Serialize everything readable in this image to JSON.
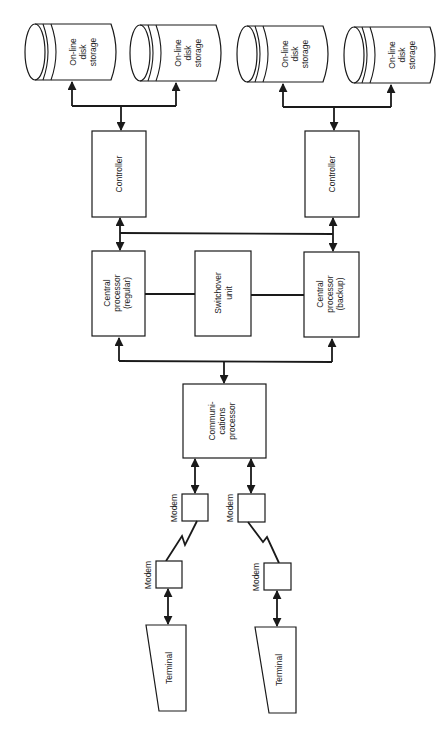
{
  "diagram": {
    "type": "block-diagram",
    "orientation": "rotated-90",
    "colors": {
      "line": "#1a1a1a",
      "background": "#ffffff"
    },
    "disks": [
      {
        "id": "disk-1",
        "lines": [
          "On-line",
          "disk",
          "storage"
        ]
      },
      {
        "id": "disk-2",
        "lines": [
          "On-line",
          "disk",
          "storage"
        ]
      },
      {
        "id": "disk-3",
        "lines": [
          "On-line",
          "disk",
          "storage"
        ]
      },
      {
        "id": "disk-4",
        "lines": [
          "On-line",
          "disk",
          "storage"
        ]
      }
    ],
    "controllers": [
      {
        "id": "controller-left",
        "label": "Controller"
      },
      {
        "id": "controller-right",
        "label": "Controller"
      }
    ],
    "processors": {
      "regular": {
        "lines": [
          "Central",
          "processor",
          "(regular)"
        ]
      },
      "switchover": {
        "lines": [
          "Switchover",
          "unit"
        ]
      },
      "backup": {
        "lines": [
          "Central",
          "processor",
          "(backup)"
        ]
      }
    },
    "communications_processor": {
      "lines": [
        "Communi-",
        "cations",
        "processor"
      ]
    },
    "modems": [
      {
        "id": "modem-upper-left",
        "label": "Modem"
      },
      {
        "id": "modem-upper-right",
        "label": "Modem"
      },
      {
        "id": "modem-lower-left",
        "label": "Modem"
      },
      {
        "id": "modem-lower-right",
        "label": "Modem"
      }
    ],
    "terminals": [
      {
        "id": "terminal-left",
        "label": "Terminal"
      },
      {
        "id": "terminal-right",
        "label": "Terminal"
      }
    ],
    "connections": [
      [
        "controller-left",
        "disk-1"
      ],
      [
        "controller-left",
        "disk-2"
      ],
      [
        "controller-right",
        "disk-3"
      ],
      [
        "controller-right",
        "disk-4"
      ],
      [
        "controller-left",
        "central-processor-regular"
      ],
      [
        "controller-right",
        "central-processor-backup"
      ],
      [
        "controller-left",
        "controller-right"
      ],
      [
        "central-processor-regular",
        "switchover-unit"
      ],
      [
        "switchover-unit",
        "central-processor-backup"
      ],
      [
        "communications-processor",
        "central-processor-regular"
      ],
      [
        "communications-processor",
        "central-processor-backup"
      ],
      [
        "communications-processor",
        "modem-upper-left"
      ],
      [
        "communications-processor",
        "modem-upper-right"
      ],
      [
        "modem-upper-left",
        "modem-lower-left"
      ],
      [
        "modem-upper-right",
        "modem-lower-right"
      ],
      [
        "modem-lower-left",
        "terminal-left"
      ],
      [
        "modem-lower-right",
        "terminal-right"
      ]
    ]
  }
}
